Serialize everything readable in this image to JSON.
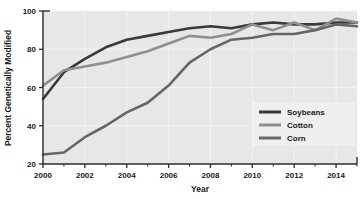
{
  "chart_data": {
    "type": "line",
    "title": "",
    "xlabel": "Year",
    "ylabel": "Percent Genetically Modified",
    "xlim": [
      2000,
      2015
    ],
    "ylim": [
      20,
      100
    ],
    "grid": true,
    "legend_position": "bottom-right",
    "x_ticks": [
      "2000",
      "2002",
      "2004",
      "2006",
      "2008",
      "2010",
      "2012",
      "2014"
    ],
    "x_tick_values": [
      2000,
      2002,
      2004,
      2006,
      2008,
      2010,
      2012,
      2014
    ],
    "x_minor_tick_values": [
      2001,
      2003,
      2005,
      2007,
      2009,
      2011,
      2013,
      2015
    ],
    "y_ticks": [
      "20",
      "40",
      "60",
      "80",
      "100"
    ],
    "y_tick_values": [
      20,
      40,
      60,
      80,
      100
    ],
    "x": [
      2000,
      2001,
      2002,
      2003,
      2004,
      2005,
      2006,
      2007,
      2008,
      2009,
      2010,
      2011,
      2012,
      2013,
      2014,
      2015
    ],
    "series": [
      {
        "name": "Soybeans",
        "color": "#3a3a3a",
        "values": [
          54,
          68,
          75,
          81,
          85,
          87,
          89,
          91,
          92,
          91,
          93,
          94,
          93,
          93,
          94,
          94
        ]
      },
      {
        "name": "Cotton",
        "color": "#8f8f8f",
        "values": [
          61,
          69,
          71,
          73,
          76,
          79,
          83,
          87,
          86,
          88,
          93,
          90,
          94,
          90,
          96,
          94
        ]
      },
      {
        "name": "Corn",
        "color": "#666666",
        "values": [
          25,
          26,
          34,
          40,
          47,
          52,
          61,
          73,
          80,
          85,
          86,
          88,
          88,
          90,
          93,
          92
        ]
      }
    ]
  },
  "legend": {
    "items": [
      {
        "label": "Soybeans",
        "color": "#3a3a3a"
      },
      {
        "label": "Cotton",
        "color": "#8f8f8f"
      },
      {
        "label": "Corn",
        "color": "#666666"
      }
    ]
  },
  "colors": {
    "plot_background": "#e7e7e7",
    "gridline": "#f4f4f4",
    "axis": "#2b2b2b",
    "legend_background": "#efefef",
    "page_background": "#ffffff"
  }
}
